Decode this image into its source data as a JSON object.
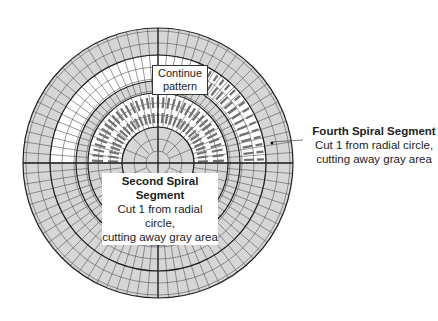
{
  "diagram": {
    "colors": {
      "gray_fill": "#d6d6d6",
      "white_fill": "#ffffff",
      "grid_line": "#555555",
      "bold_line": "#222222",
      "cut_mark": "#707070"
    },
    "labels": {
      "continue": {
        "line1": "Continue",
        "line2": "pattern"
      },
      "second_segment": {
        "title": "Second Spiral Segment",
        "line1": "Cut 1 from radial circle,",
        "line2": "cutting away gray area"
      },
      "fourth_segment": {
        "title": "Fourth Spiral Segment",
        "line1": "Cut 1 from radial circle,",
        "line2": "cutting away gray area"
      }
    }
  }
}
